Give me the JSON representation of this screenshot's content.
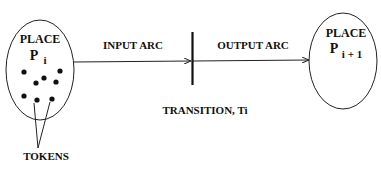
{
  "diagram": {
    "type": "petri-net",
    "place_left": {
      "label": "PLACE",
      "symbol": "P",
      "subscript": "i"
    },
    "place_right": {
      "label": "PLACE",
      "symbol": "P",
      "subscript": "i + 1"
    },
    "input_arc": {
      "label": "INPUT ARC"
    },
    "output_arc": {
      "label": "OUTPUT ARC"
    },
    "transition": {
      "label": "TRANSITION, Ti"
    },
    "tokens": {
      "label": "TOKENS",
      "count": 8
    }
  }
}
